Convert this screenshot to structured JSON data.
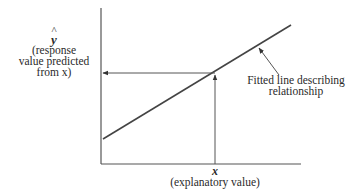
{
  "diagram": {
    "type": "regression-line-schematic",
    "y_axis": {
      "symbol": "y",
      "symbol_accent": "^",
      "description_lines": [
        "(response",
        "value predicted",
        "from x)"
      ]
    },
    "x_axis": {
      "symbol": "x",
      "description": "(explanatory value)"
    },
    "fitted_line_label": {
      "lines": [
        "Fitted line describing",
        "relationship"
      ]
    },
    "colors": {
      "line": "#444444",
      "axis": "#555555",
      "text": "#2a2a2a",
      "background": "#ffffff"
    }
  }
}
